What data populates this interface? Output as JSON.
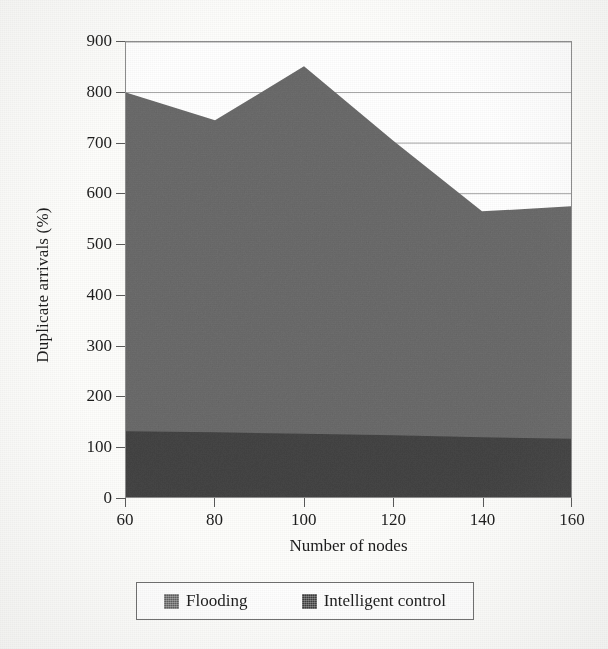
{
  "chart_data": {
    "type": "area",
    "stacked": true,
    "title": "",
    "xlabel": "Number of nodes",
    "ylabel": "Duplicate arrivals (%)",
    "x": [
      60,
      80,
      100,
      120,
      140,
      160
    ],
    "xticklabels": [
      "60",
      "80",
      "100",
      "120",
      "140",
      "160"
    ],
    "yticklabels": [
      "0",
      "100",
      "200",
      "300",
      "400",
      "500",
      "600",
      "700",
      "800",
      "900"
    ],
    "yticks": [
      0,
      100,
      200,
      300,
      400,
      500,
      600,
      700,
      800,
      900
    ],
    "xlim": [
      60,
      160
    ],
    "ylim": [
      0,
      900
    ],
    "grid": "horizontal",
    "legend_position": "below-axes",
    "series": [
      {
        "name": "Flooding",
        "color": "#6e6e6e",
        "values": [
          670,
          617,
          727,
          583,
          447,
          460
        ],
        "cumulative_top": [
          800,
          745,
          852,
          705,
          565,
          575
        ]
      },
      {
        "name": "Intelligent control",
        "color": "#464646",
        "values": [
          130,
          128,
          125,
          122,
          118,
          115
        ],
        "cumulative_top": [
          130,
          128,
          125,
          122,
          118,
          115
        ]
      }
    ]
  },
  "legend": {
    "entries": [
      {
        "label": "Flooding",
        "color": "#6e6e6e"
      },
      {
        "label": "Intelligent control",
        "color": "#464646"
      }
    ]
  },
  "colors": {
    "flooding": "#6e6e6e",
    "intelligent_control": "#464646",
    "axis": "#5a5a5a",
    "gridline": "#9a9a9a",
    "background": "#fdfdfb"
  }
}
